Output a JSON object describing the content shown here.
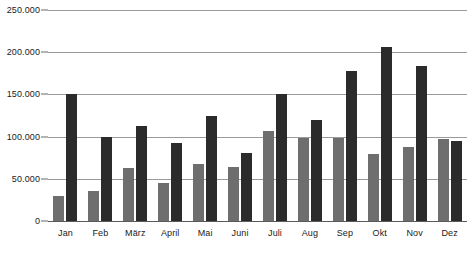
{
  "chart_data": {
    "type": "bar",
    "title": "",
    "xlabel": "",
    "ylabel": "",
    "categories": [
      "Jan",
      "Feb",
      "März",
      "April",
      "Mai",
      "Juni",
      "Juli",
      "Aug",
      "Sep",
      "Okt",
      "Nov",
      "Dez"
    ],
    "series": [
      {
        "name": "series-1",
        "color": "#6e6e6e",
        "values": [
          30000,
          35000,
          63000,
          45000,
          67000,
          64000,
          107000,
          98000,
          98000,
          79000,
          88000,
          97000
        ]
      },
      {
        "name": "series-2",
        "color": "#2b2b2b",
        "values": [
          150000,
          100000,
          112000,
          92000,
          124000,
          81000,
          150000,
          120000,
          178000,
          206000,
          184000,
          95000
        ]
      }
    ],
    "ylim": [
      0,
      250000
    ],
    "ytick_values": [
      0,
      50000,
      100000,
      150000,
      200000,
      250000
    ],
    "ytick_labels": [
      "0",
      "50.000",
      "100.000",
      "150.000",
      "200.000",
      "250.000"
    ],
    "grid": true,
    "legend": "none"
  }
}
